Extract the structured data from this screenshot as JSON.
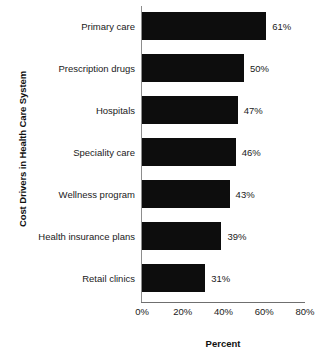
{
  "chart_data": {
    "type": "bar",
    "orientation": "horizontal",
    "title": "",
    "xlabel": "Percent",
    "ylabel": "Cost Drivers in Health Care System",
    "categories": [
      "Primary care",
      "Prescription drugs",
      "Hospitals",
      "Speciality care",
      "Wellness program",
      "Health insurance plans",
      "Retail clinics"
    ],
    "values": [
      61,
      50,
      47,
      46,
      43,
      39,
      31
    ],
    "value_labels": [
      "61%",
      "50%",
      "47%",
      "46%",
      "43%",
      "39%",
      "31%"
    ],
    "xlim": [
      0,
      80
    ],
    "xticks": [
      0,
      20,
      40,
      60,
      80
    ],
    "xtick_labels": [
      "0%",
      "20%",
      "40%",
      "60%",
      "80%"
    ],
    "grid": false,
    "legend": false,
    "bar_color": "#0d0d0d",
    "background_color": "#ffffff",
    "axis_color": "#6f6f6f"
  }
}
